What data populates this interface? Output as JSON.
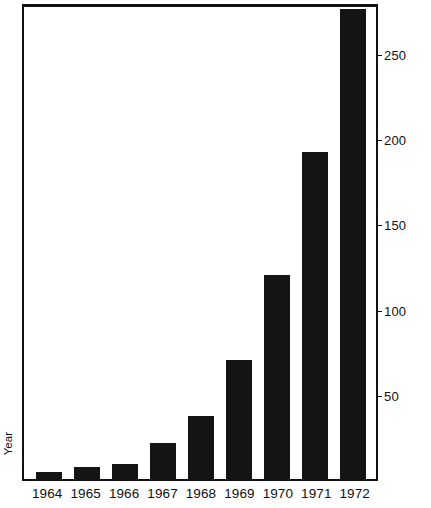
{
  "chart_data": {
    "type": "bar",
    "title": "",
    "xlabel": "Year",
    "ylabel": "Number of Alternative Public Schools in Operation",
    "categories": [
      "1964",
      "1965",
      "1966",
      "1967",
      "1968",
      "1969",
      "1970",
      "1971",
      "1972"
    ],
    "values": [
      4,
      7,
      9,
      21,
      37,
      70,
      120,
      192,
      276
    ],
    "ylim": [
      0,
      280
    ],
    "yticks": [
      50,
      100,
      150,
      200,
      250
    ],
    "ytick_labels": [
      "50",
      "100",
      "150",
      "200",
      "250"
    ],
    "grid": false,
    "legend": null,
    "axis_position": "right",
    "bar_color": "#141414"
  },
  "axes": {
    "y_title": "Number of Alternative Public Schools in Operation",
    "x_title": "Year"
  }
}
